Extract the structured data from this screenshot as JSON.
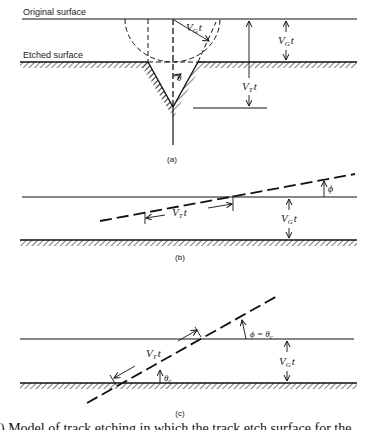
{
  "figure": {
    "panels": [
      {
        "id": "a",
        "caption": "(a)",
        "labels": {
          "original_surface": "Original surface",
          "etched_surface": "Etched surface",
          "vg_radius": "V",
          "vg_radius_sub": "G",
          "vg_radius_suffix": "t",
          "vg_thickness": "V",
          "vg_thickness_sub": "G",
          "vg_thickness_suffix": "t",
          "vt_depth": "V",
          "vt_depth_sub": "T",
          "vt_depth_suffix": "t",
          "cone_angle": "θ"
        }
      },
      {
        "id": "b",
        "caption": "(b)",
        "labels": {
          "vt_length": "V",
          "vt_length_sub": "T",
          "vt_length_suffix": "t",
          "vg_thickness": "V",
          "vg_thickness_sub": "G",
          "vg_thickness_suffix": "t",
          "dip_angle": "ϕ"
        }
      },
      {
        "id": "c",
        "caption": "(c)",
        "labels": {
          "vt_length": "V",
          "vt_length_sub": "T",
          "vt_length_suffix": "t",
          "vg_thickness": "V",
          "vg_thickness_sub": "G",
          "vg_thickness_suffix": "t",
          "critical_angle": "ϕ = θ",
          "critical_angle_sub": "c",
          "theta_c": "θ",
          "theta_c_sub": "c"
        }
      }
    ],
    "bottom_caption": ") Model of track etching in which the track etch surface for the ..."
  }
}
